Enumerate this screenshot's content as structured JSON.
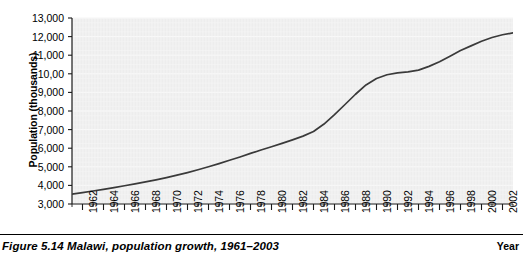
{
  "figure": {
    "caption": "Figure 5.14 Malawi, population growth, 1961–2003",
    "axis_title_y": "Population (thousands)",
    "axis_title_x": "Year"
  },
  "chart_data": {
    "type": "line",
    "title": "",
    "subtitle": "",
    "xlabel": "Year",
    "ylabel": "Population (thousands)",
    "xlim": [
      1961,
      2003
    ],
    "ylim": [
      3000,
      13000
    ],
    "grid": true,
    "legend": "none",
    "y_tick_labels": [
      "13,000",
      "12,000",
      "11,000",
      "10,00",
      "9,000",
      "8,000",
      "7,000",
      "6,000",
      "5,000",
      "4,000",
      "3,000"
    ],
    "y_tick_values": [
      13000,
      12000,
      11000,
      10000,
      9000,
      8000,
      7000,
      6000,
      5000,
      4000,
      3000
    ],
    "x_tick_labels": [
      "1962",
      "1964",
      "1966",
      "1968",
      "1970",
      "1972",
      "1974",
      "1976",
      "1978",
      "1980",
      "1982",
      "1984",
      "1986",
      "1988",
      "1990",
      "1992",
      "1994",
      "1996",
      "1998",
      "2000",
      "2002"
    ],
    "x_tick_values": [
      1962,
      1964,
      1966,
      1968,
      1970,
      1972,
      1974,
      1976,
      1978,
      1980,
      1982,
      1984,
      1986,
      1988,
      1990,
      1992,
      1994,
      1996,
      1998,
      2000,
      2002
    ],
    "x_minor_ticks": [
      1961,
      1963,
      1965,
      1967,
      1969,
      1971,
      1973,
      1975,
      1977,
      1979,
      1981,
      1983,
      1985,
      1987,
      1989,
      1991,
      1993,
      1995,
      1997,
      1999,
      2001,
      2003
    ],
    "line_color": "#3a3a3a",
    "plot_background": "#ededed",
    "gridline_color": "#fbfbfb",
    "series": [
      {
        "name": "Population",
        "x": [
          1961,
          1962,
          1963,
          1964,
          1965,
          1966,
          1967,
          1968,
          1969,
          1970,
          1971,
          1972,
          1973,
          1974,
          1975,
          1976,
          1977,
          1978,
          1979,
          1980,
          1981,
          1982,
          1983,
          1984,
          1985,
          1986,
          1987,
          1988,
          1989,
          1990,
          1991,
          1992,
          1993,
          1994,
          1995,
          1996,
          1997,
          1998,
          1999,
          2000,
          2001,
          2002,
          2003
        ],
        "values": [
          3530,
          3610,
          3700,
          3790,
          3880,
          3980,
          4080,
          4190,
          4300,
          4420,
          4550,
          4690,
          4840,
          5000,
          5170,
          5350,
          5530,
          5720,
          5900,
          6080,
          6260,
          6450,
          6650,
          6900,
          7300,
          7800,
          8350,
          8900,
          9400,
          9750,
          9950,
          10050,
          10100,
          10200,
          10400,
          10650,
          10950,
          11250,
          11500,
          11750,
          11950,
          12100,
          12200
        ]
      }
    ]
  }
}
